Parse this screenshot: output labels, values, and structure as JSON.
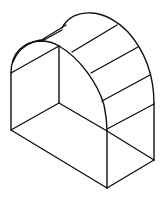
{
  "figure": {
    "title": "Isometric line drawing of an arched greenhouse frame",
    "line_color": "#111111",
    "background": "#ffffff"
  }
}
